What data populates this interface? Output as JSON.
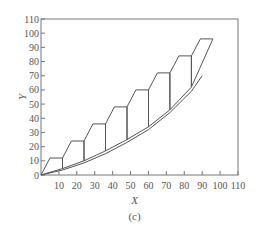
{
  "chart_data": {
    "type": "line",
    "title": "",
    "caption": "(c)",
    "xlabel": "X",
    "ylabel": "Y",
    "xlim": [
      0,
      110
    ],
    "ylim": [
      0,
      110
    ],
    "x_ticks": [
      10,
      20,
      30,
      40,
      50,
      60,
      70,
      80,
      90,
      100,
      110
    ],
    "y_ticks": [
      0,
      10,
      20,
      30,
      40,
      50,
      60,
      70,
      80,
      90,
      100,
      110
    ],
    "grid": false,
    "legend": null,
    "series": [
      {
        "name": "staircase",
        "points": [
          [
            0,
            0
          ],
          [
            5,
            12
          ],
          [
            12,
            12
          ],
          [
            12,
            4.5
          ],
          [
            12,
            12
          ],
          [
            17,
            24
          ],
          [
            24,
            24
          ],
          [
            24,
            10
          ],
          [
            24,
            24
          ],
          [
            29,
            36
          ],
          [
            36,
            36
          ],
          [
            36,
            17
          ],
          [
            36,
            36
          ],
          [
            41,
            48
          ],
          [
            48,
            48
          ],
          [
            48,
            25
          ],
          [
            48,
            48
          ],
          [
            53,
            60
          ],
          [
            60,
            60
          ],
          [
            60,
            34
          ],
          [
            60,
            60
          ],
          [
            65,
            72
          ],
          [
            72,
            72
          ],
          [
            72,
            46
          ],
          [
            72,
            72
          ],
          [
            77,
            84
          ],
          [
            84,
            84
          ],
          [
            84,
            62
          ],
          [
            84,
            84
          ],
          [
            89,
            96
          ],
          [
            96,
            96
          ]
        ]
      },
      {
        "name": "upper-curve",
        "points": [
          [
            0,
            0
          ],
          [
            12,
            4.5
          ],
          [
            24,
            10
          ],
          [
            36,
            17
          ],
          [
            48,
            25
          ],
          [
            60,
            34
          ],
          [
            72,
            46
          ],
          [
            84,
            62
          ],
          [
            96,
            96
          ]
        ]
      },
      {
        "name": "lower-curve",
        "points": [
          [
            0,
            0
          ],
          [
            12,
            3.5
          ],
          [
            24,
            8.5
          ],
          [
            36,
            15
          ],
          [
            48,
            23
          ],
          [
            60,
            32
          ],
          [
            72,
            44
          ],
          [
            84,
            59
          ],
          [
            90,
            70
          ]
        ]
      }
    ]
  }
}
